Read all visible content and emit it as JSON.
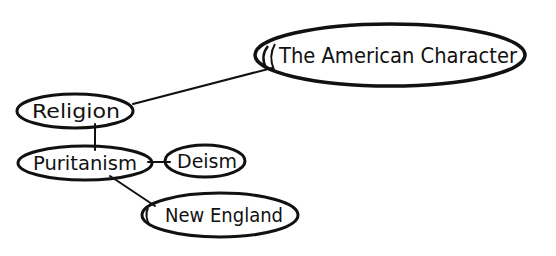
{
  "diagram": {
    "type": "mind-map",
    "colors": {
      "ink": "#111111",
      "background": "#ffffff"
    },
    "nodes": [
      {
        "id": "american-character",
        "label": "The American Character"
      },
      {
        "id": "religion",
        "label": "Religion"
      },
      {
        "id": "puritanism",
        "label": "Puritanism"
      },
      {
        "id": "deism",
        "label": "Deism"
      },
      {
        "id": "new-england",
        "label": "New England"
      }
    ],
    "edges": [
      {
        "from": "religion",
        "to": "american-character"
      },
      {
        "from": "religion",
        "to": "puritanism"
      },
      {
        "from": "puritanism",
        "to": "deism"
      },
      {
        "from": "puritanism",
        "to": "new-england"
      }
    ]
  }
}
